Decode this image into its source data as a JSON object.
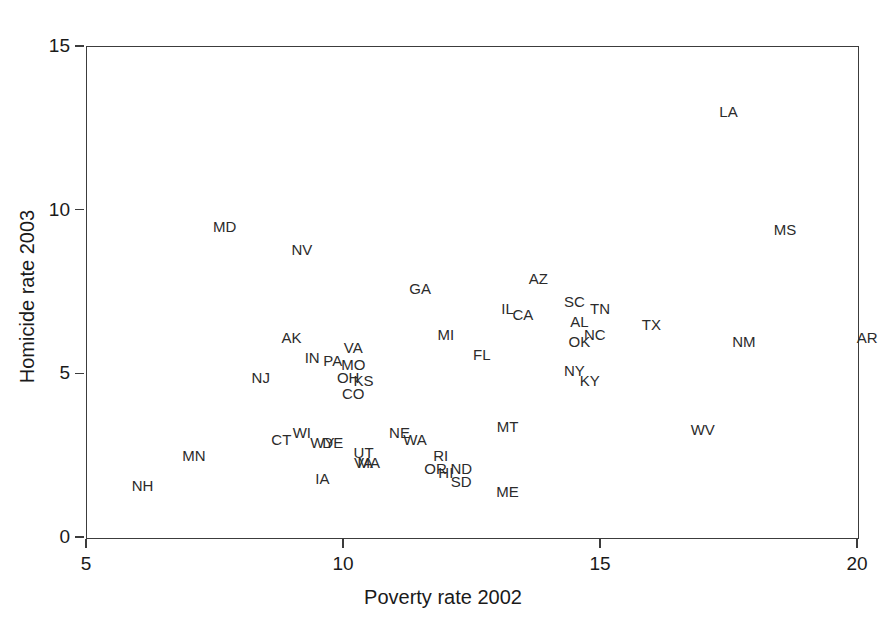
{
  "chart_data": {
    "type": "scatter",
    "title": "",
    "xlabel": "Poverty rate 2002",
    "ylabel": "Homicide rate 2003",
    "xlim": [
      4.5,
      20.5
    ],
    "ylim": [
      -0.4,
      15.5
    ],
    "xticks": [
      5,
      10,
      15,
      20
    ],
    "yticks": [
      0,
      5,
      10,
      15
    ],
    "xtick_labels": [
      "5",
      "10",
      "15",
      "20"
    ],
    "ytick_labels": [
      "0",
      "5",
      "10",
      "15"
    ],
    "grid": false,
    "legend": "none",
    "marker_style": "text-label",
    "point_label_field": "label",
    "series_name": "US states",
    "points": [
      {
        "label": "LA",
        "x": 17.5,
        "y": 13.0
      },
      {
        "label": "MD",
        "x": 7.7,
        "y": 9.5
      },
      {
        "label": "MS",
        "x": 18.6,
        "y": 9.4
      },
      {
        "label": "NV",
        "x": 9.2,
        "y": 8.8
      },
      {
        "label": "AZ",
        "x": 13.8,
        "y": 7.9
      },
      {
        "label": "GA",
        "x": 11.5,
        "y": 7.6
      },
      {
        "label": "SC",
        "x": 14.5,
        "y": 7.2
      },
      {
        "label": "TN",
        "x": 15.0,
        "y": 7.0
      },
      {
        "label": "IL",
        "x": 13.2,
        "y": 7.0
      },
      {
        "label": "CA",
        "x": 13.5,
        "y": 6.8
      },
      {
        "label": "AL",
        "x": 14.6,
        "y": 6.6
      },
      {
        "label": "TX",
        "x": 16.0,
        "y": 6.5
      },
      {
        "label": "NC",
        "x": 14.9,
        "y": 6.2
      },
      {
        "label": "MI",
        "x": 12.0,
        "y": 6.2
      },
      {
        "label": "OK",
        "x": 14.6,
        "y": 6.0
      },
      {
        "label": "AK",
        "x": 9.0,
        "y": 6.1
      },
      {
        "label": "NM",
        "x": 17.8,
        "y": 6.0
      },
      {
        "label": "AR",
        "x": 20.2,
        "y": 6.1
      },
      {
        "label": "VA",
        "x": 10.2,
        "y": 5.8
      },
      {
        "label": "FL",
        "x": 12.7,
        "y": 5.6
      },
      {
        "label": "IN",
        "x": 9.4,
        "y": 5.5
      },
      {
        "label": "PA",
        "x": 9.8,
        "y": 5.4
      },
      {
        "label": "MO",
        "x": 10.2,
        "y": 5.3
      },
      {
        "label": "NY",
        "x": 14.5,
        "y": 5.1
      },
      {
        "label": "NJ",
        "x": 8.4,
        "y": 4.9
      },
      {
        "label": "OH",
        "x": 10.1,
        "y": 4.9
      },
      {
        "label": "KS",
        "x": 10.4,
        "y": 4.8
      },
      {
        "label": "KY",
        "x": 14.8,
        "y": 4.8
      },
      {
        "label": "CO",
        "x": 10.2,
        "y": 4.4
      },
      {
        "label": "MT",
        "x": 13.2,
        "y": 3.4
      },
      {
        "label": "WV",
        "x": 17.0,
        "y": 3.3
      },
      {
        "label": "WI",
        "x": 9.2,
        "y": 3.2
      },
      {
        "label": "NE",
        "x": 11.1,
        "y": 3.2
      },
      {
        "label": "WA",
        "x": 11.4,
        "y": 3.0
      },
      {
        "label": "CT",
        "x": 8.8,
        "y": 3.0
      },
      {
        "label": "WY",
        "x": 9.6,
        "y": 2.9
      },
      {
        "label": "DE",
        "x": 9.8,
        "y": 2.9
      },
      {
        "label": "MN",
        "x": 7.1,
        "y": 2.5
      },
      {
        "label": "UT",
        "x": 10.4,
        "y": 2.6
      },
      {
        "label": "RI",
        "x": 11.9,
        "y": 2.5
      },
      {
        "label": "VA2",
        "x": 10.4,
        "y": 2.3
      },
      {
        "label": "MA",
        "x": 10.5,
        "y": 2.3
      },
      {
        "label": "OR",
        "x": 11.8,
        "y": 2.1
      },
      {
        "label": "HI",
        "x": 12.0,
        "y": 2.0
      },
      {
        "label": "ND",
        "x": 12.3,
        "y": 2.1
      },
      {
        "label": "IA",
        "x": 9.6,
        "y": 1.8
      },
      {
        "label": "SD",
        "x": 12.3,
        "y": 1.7
      },
      {
        "label": "NH",
        "x": 6.1,
        "y": 1.6
      },
      {
        "label": "ME",
        "x": 13.2,
        "y": 1.4
      }
    ]
  },
  "axes": {
    "x_title": "Poverty rate 2002",
    "y_title": "Homicide rate 2003"
  },
  "labels": {
    "LA": "LA",
    "MD": "MD",
    "MS": "MS",
    "NV": "NV",
    "AZ": "AZ",
    "GA": "GA",
    "SC": "SC",
    "TN": "TN",
    "IL": "IL",
    "CA": "CA",
    "AL": "AL",
    "TX": "TX",
    "NC": "NC",
    "MI": "MI",
    "OK": "OK",
    "AK": "AK",
    "NM": "NM",
    "AR": "AR",
    "VA": "VA",
    "FL": "FL",
    "IN": "IN",
    "PA": "PA",
    "MO": "MO",
    "NY": "NY",
    "NJ": "NJ",
    "OH": "OH",
    "KS": "KS",
    "KY": "KY",
    "CO": "CO",
    "MT": "MT",
    "WV": "WV",
    "WI": "WI",
    "NE": "NE",
    "WA": "WA",
    "CT": "CT",
    "WY": "WY",
    "DE": "DE",
    "MN": "MN",
    "UT": "UT",
    "RI": "RI",
    "VA2": "VA",
    "MA": "MA",
    "OR": "OR",
    "HI": "HI",
    "ND": "ND",
    "IA": "IA",
    "SD": "SD",
    "NH": "NH",
    "ME": "ME"
  },
  "colors": {
    "background": "#ffffff",
    "frame": "#3c3c3c",
    "label_text": "#2b2b2b",
    "axis_text": "#1a1a1a"
  }
}
